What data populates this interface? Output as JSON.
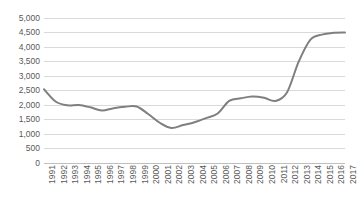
{
  "chart_data": {
    "type": "line",
    "title": "",
    "subtitle": "",
    "xlabel": "",
    "ylabel": "",
    "ylim": [
      0,
      5000
    ],
    "ytick_step": 500,
    "yticks": [
      0,
      500,
      1000,
      1500,
      2000,
      2500,
      3000,
      3500,
      4000,
      4500,
      5000
    ],
    "ytick_labels": [
      "0",
      "500",
      "1,000",
      "1,500",
      "2,000",
      "2,500",
      "3,000",
      "3,500",
      "4,000",
      "4,500",
      "5,000"
    ],
    "grid": true,
    "grid_axis": "y",
    "legend": false,
    "legend_position": "none",
    "categories": [
      "1991",
      "1992",
      "1993",
      "1994",
      "1995",
      "1996",
      "1997",
      "1998",
      "1999",
      "2000",
      "2001",
      "2002",
      "2003",
      "2004",
      "2005",
      "2006",
      "2007",
      "2008",
      "2009",
      "2010",
      "2011",
      "2012",
      "2013",
      "2014",
      "2015",
      "2016",
      "2017"
    ],
    "values": [
      2550,
      2130,
      2000,
      2010,
      1930,
      1820,
      1900,
      1950,
      1960,
      1700,
      1400,
      1220,
      1320,
      1420,
      1560,
      1720,
      2150,
      2240,
      2300,
      2260,
      2150,
      2450,
      3500,
      4250,
      4430,
      4490,
      4500
    ],
    "series": [
      {
        "name": "Series 1",
        "color": "#7f7f7f",
        "values": [
          2550,
          2130,
          2000,
          2010,
          1930,
          1820,
          1900,
          1950,
          1960,
          1700,
          1400,
          1220,
          1320,
          1420,
          1560,
          1720,
          2150,
          2240,
          2300,
          2260,
          2150,
          2450,
          3500,
          4250,
          4430,
          4490,
          4500
        ]
      }
    ],
    "annotations": []
  },
  "style": {
    "line_color": "#7f7f7f",
    "gridline_color": "#d9d9d9",
    "axis_color": "#bfbfbf",
    "tick_label_color": "#595959",
    "background": "#ffffff"
  }
}
